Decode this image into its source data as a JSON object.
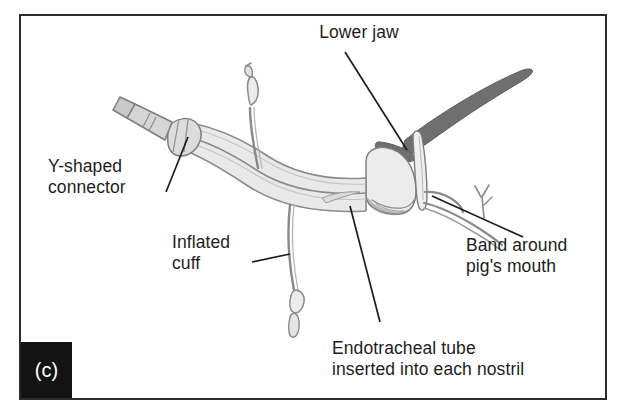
{
  "figure": {
    "panel_letter": "(c)",
    "frame_color": "#2b2b2b",
    "background_color": "#ffffff",
    "tube_fill_color": "#e9e9e9",
    "tube_outline_color": "#8a8a8a",
    "dark_tissue_color": "#6f6f6f",
    "text_color": "#1d1d1d",
    "leader_line_color": "#1d1d1d"
  },
  "labels": {
    "lower_jaw": "Lower jaw",
    "y_shaped_connector": "Y-shaped\nconnector",
    "inflated_cuff": "Inflated\ncuff",
    "band_around_pigs_mouth": "Band around\npig's mouth",
    "endotracheal_tube": "Endotracheal tube\ninserted into each nostril"
  }
}
